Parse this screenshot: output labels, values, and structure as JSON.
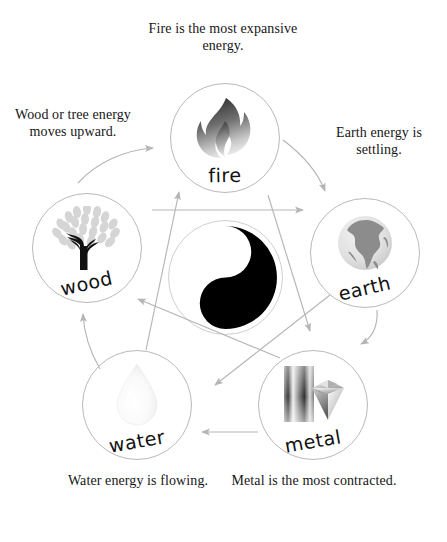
{
  "diagram": {
    "center": {
      "icon": "yin-yang-icon",
      "label": ""
    },
    "nodes": [
      {
        "id": "fire",
        "label": "fire",
        "icon": "flame-icon",
        "caption": "Fire is the most expansive energy."
      },
      {
        "id": "wood",
        "label": "wood",
        "icon": "tree-icon",
        "caption": "Wood or tree energy moves upward."
      },
      {
        "id": "earth",
        "label": "earth",
        "icon": "globe-icon",
        "caption": "Earth energy is settling."
      },
      {
        "id": "water",
        "label": "water",
        "icon": "water-drop-icon",
        "caption": "Water energy is flowing."
      },
      {
        "id": "metal",
        "label": "metal",
        "icon": "metal-bar-and-diamond-icon",
        "caption": "Metal is the most contracted."
      }
    ],
    "captions": {
      "fire": "Fire is the most expansive energy.",
      "wood": "Wood or tree energy moves upward.",
      "earth": "Earth energy is settling.",
      "water": "Water energy is flowing.",
      "metal": "Metal is the most contracted."
    },
    "arrows": {
      "generating_cycle": [
        {
          "from": "wood",
          "to": "fire",
          "style": "curved"
        },
        {
          "from": "fire",
          "to": "earth",
          "style": "curved"
        },
        {
          "from": "earth",
          "to": "metal",
          "style": "curved"
        },
        {
          "from": "metal",
          "to": "water",
          "style": "straight"
        },
        {
          "from": "water",
          "to": "wood",
          "style": "curved"
        }
      ],
      "controlling_cycle": [
        {
          "from": "wood",
          "to": "earth",
          "style": "straight"
        },
        {
          "from": "earth",
          "to": "water",
          "style": "straight"
        },
        {
          "from": "water",
          "to": "fire",
          "style": "straight"
        },
        {
          "from": "fire",
          "to": "metal",
          "style": "straight"
        },
        {
          "from": "metal",
          "to": "wood",
          "style": "straight"
        }
      ]
    },
    "colors": {
      "background": "#ffffff",
      "text": "#161616",
      "circle_stroke": "#b9b9b9",
      "arrow": "#b5b5b5",
      "yin": "#000000",
      "yang": "#ffffff"
    }
  }
}
